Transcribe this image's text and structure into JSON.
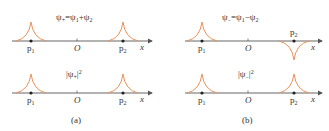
{
  "colors": {
    "curve": "#e8915a",
    "axis": "#555555",
    "text": "#333333"
  },
  "panels": [
    {
      "caption": "(a)",
      "top": {
        "formula": "ψ+=ψ1+ψ2",
        "formula_main": "ψ",
        "formula_sub": "+",
        "formula_rest": "=ψ",
        "formula_sub1": "1",
        "formula_plus": "+ψ",
        "formula_sub2": "2"
      },
      "bottom": {
        "formula": "|ψ+|²"
      },
      "labels": {
        "p1": "p",
        "p1_sub": "1",
        "origin": "O",
        "p2": "p",
        "p2_sub": "2",
        "x": "x"
      }
    },
    {
      "caption": "(b)",
      "top": {
        "formula": "ψ−=ψ1−ψ2"
      },
      "bottom": {
        "formula": "|ψ−|²"
      },
      "labels": {
        "p1": "p",
        "p1_sub": "1",
        "origin": "O",
        "p2": "p",
        "p2_sub": "2",
        "x": "x"
      }
    }
  ],
  "text": {
    "a_top_formula": "ψ+=ψ1+ψ2",
    "b_top_formula": "ψ−=ψ1−ψ2",
    "a_bottom_formula": "|ψ+|2",
    "b_bottom_formula": "|ψ−|2",
    "caption_a": "(a)",
    "caption_b": "(b)",
    "p": "p",
    "sub1": "1",
    "sub2": "2",
    "origin": "O",
    "x": "x",
    "psi": "ψ",
    "plus": "+",
    "minus": "−",
    "eq": "=",
    "bar": "|",
    "sq": "2"
  }
}
